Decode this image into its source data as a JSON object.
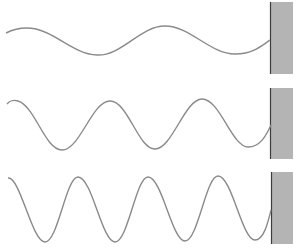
{
  "diagram": {
    "colors": {
      "wave": "#8a8a8a",
      "wall_fill": "#b4b4b4",
      "wall_edge": "#3c3c3c",
      "background": "#ffffff"
    },
    "waves": [
      {
        "id": "wave-1",
        "label": "",
        "cycles": 2
      },
      {
        "id": "wave-2",
        "label": "",
        "cycles": 3
      },
      {
        "id": "wave-3",
        "label": "",
        "cycles": 4
      }
    ],
    "walls": [
      {
        "id": "wall-1",
        "x": 270,
        "y": 2,
        "w": 23,
        "h": 72
      },
      {
        "id": "wall-2",
        "x": 270,
        "y": 88,
        "w": 23,
        "h": 71
      },
      {
        "id": "wall-3",
        "x": 271,
        "y": 172,
        "w": 22,
        "h": 72
      }
    ]
  }
}
